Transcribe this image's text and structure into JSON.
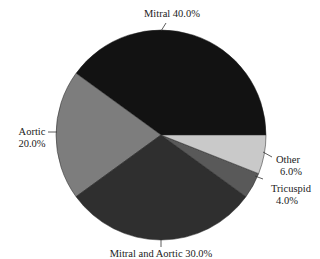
{
  "chart_data": {
    "type": "pie",
    "title": "",
    "slices": [
      {
        "label": "Mitral",
        "value": 40.0,
        "display": "40.0%",
        "color": "#121212"
      },
      {
        "label": "Aortic",
        "value": 20.0,
        "display": "20.0%",
        "color": "#7d7d7d"
      },
      {
        "label": "Mitral and Aortic",
        "value": 30.0,
        "display": "30.0%",
        "color": "#2f2f2f"
      },
      {
        "label": "Tricuspid",
        "value": 4.0,
        "display": "4.0%",
        "color": "#595959"
      },
      {
        "label": "Other",
        "value": 6.0,
        "display": "6.0%",
        "color": "#c9c9c9"
      }
    ],
    "start_angle_deg": 0,
    "direction": "counterclockwise",
    "legend": "none (direct labels with leader lines)"
  },
  "labels": {
    "mitral": "Mitral 40.0%",
    "aortic_name": "Aortic",
    "aortic_pct": "20.0%",
    "mitral_aortic": "Mitral and Aortic 30.0%",
    "tricuspid_name": "Tricuspid",
    "tricuspid_pct": "4.0%",
    "other_name": "Other",
    "other_pct": "6.0%"
  }
}
